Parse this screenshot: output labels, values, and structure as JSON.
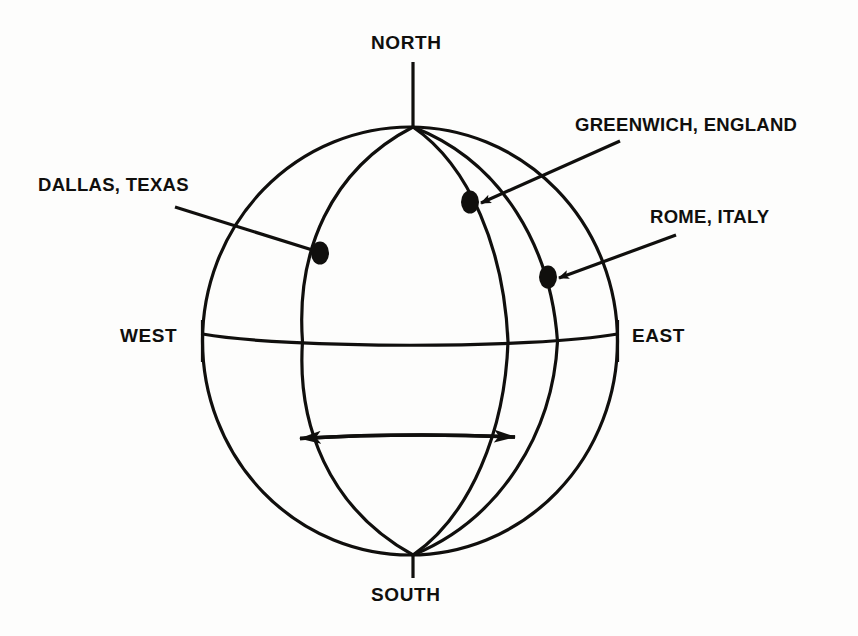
{
  "diagram": {
    "background_color": "#fdfdfc",
    "ink_color": "#100f0d",
    "cardinals": {
      "north": "NORTH",
      "south": "SOUTH",
      "west": "WEST",
      "east": "EAST"
    },
    "places": [
      {
        "id": "dallas",
        "label": "DALLAS, TEXAS",
        "label_x": 38,
        "label_y": 176,
        "marker_x": 320,
        "marker_y": 253,
        "leader_from_x": 175,
        "leader_from_y": 207,
        "arrowhead": false
      },
      {
        "id": "greenwich",
        "label": "GREENWICH, ENGLAND",
        "label_x": 575,
        "label_y": 116,
        "marker_x": 470,
        "marker_y": 202,
        "leader_from_x": 620,
        "leader_from_y": 141,
        "arrowhead": true
      },
      {
        "id": "rome",
        "label": "ROME, ITALY",
        "label_x": 650,
        "label_y": 208,
        "marker_x": 548,
        "marker_y": 277,
        "leader_from_x": 676,
        "leader_from_y": 235,
        "arrowhead": true
      }
    ],
    "globe": {
      "center_x": 410,
      "center_y": 341,
      "radius_x": 207,
      "radius_y": 214,
      "pole_north_x": 413,
      "pole_north_y": 127,
      "pole_south_x": 413,
      "pole_south_y": 555,
      "equator_y": 341,
      "meridian_equator_crossings": [
        202,
        308,
        508,
        560,
        617
      ],
      "line_width": 3
    },
    "rotation_arrow": {
      "label": "rotation-direction",
      "x_start": 281,
      "x_end": 531,
      "y": 437,
      "double_headed": true
    },
    "pole_ticks": {
      "north_tick_top": 62,
      "north_tick_bottom": 126,
      "south_tick_top": 556,
      "south_tick_bottom": 578,
      "west_tick_x": 202,
      "east_tick_x": 617,
      "tick_half_height": 21
    }
  }
}
